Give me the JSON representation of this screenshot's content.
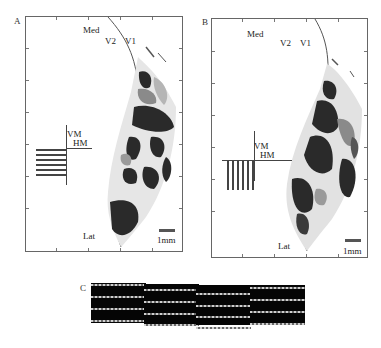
{
  "figure": {
    "top_caption_fragment": "··· ··· ··· ··· ·· ····· ·",
    "panels": {
      "A": {
        "label": "A",
        "med_label": "Med",
        "v2_label": "V2",
        "v1_label": "V1",
        "vm_label": "VM",
        "hm_label": "HM",
        "lat_label": "Lat",
        "scale_label": "1mm",
        "stimulus_orientation": "horizontal",
        "stimulus_stripes": 6
      },
      "B": {
        "label": "B",
        "med_label": "Med",
        "v2_label": "V2",
        "v1_label": "V1",
        "vm_label": "VM",
        "hm_label": "HM",
        "lat_label": "Lat",
        "scale_label": "1mm",
        "stimulus_orientation": "vertical",
        "stimulus_stripes": 6
      },
      "C": {
        "label": "C",
        "blocks": [
          {
            "lines": 4,
            "offset": 0
          },
          {
            "lines": 4,
            "offset": 5
          },
          {
            "lines": 4,
            "offset": 10
          },
          {
            "lines": 4,
            "offset": 5
          }
        ]
      }
    },
    "colors": {
      "map_dark": "#2a2a2a",
      "map_mid": "#8a8a8a",
      "map_light": "#c8c8c8",
      "frame": "#666666",
      "block": "#050505"
    }
  }
}
